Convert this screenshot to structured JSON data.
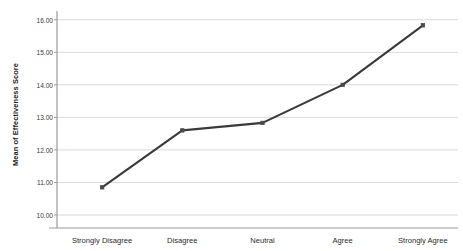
{
  "chart_data": {
    "type": "line",
    "title": "",
    "xlabel": "",
    "ylabel": "Mean of Effectiveness Score",
    "categories": [
      "Strongly Disagree",
      "Disagree",
      "Neutral",
      "Agree",
      "Strongly Agree"
    ],
    "values": [
      10.85,
      12.6,
      12.83,
      14.0,
      15.83
    ],
    "series": [
      {
        "name": "Mean of Effectiveness Score",
        "values": [
          10.85,
          12.6,
          12.83,
          14.0,
          15.83
        ]
      }
    ],
    "ylim": [
      9.6,
      16.3
    ],
    "ytick_values": [
      10.0,
      11.0,
      12.0,
      13.0,
      14.0,
      15.0,
      16.0
    ],
    "ytick_labels": [
      "10.00",
      "11.00",
      "12.00",
      "13.00",
      "14.00",
      "15.00",
      "16.00"
    ],
    "grid": true,
    "grid_axis": "y",
    "legend": false,
    "legend_position": "none",
    "line_color": "#3a3a3a",
    "marker_color": "#4a4a4a",
    "gridline_color": "#d9d9d9",
    "axis_color": "#9a9a9a",
    "background_color": "#ffffff",
    "marker": "square",
    "annotations": []
  }
}
